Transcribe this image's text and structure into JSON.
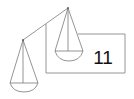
{
  "diagram": {
    "type": "balance-scale",
    "box": {
      "value": "11"
    },
    "colors": {
      "stroke": "#7a7a7a",
      "text": "#111111",
      "background": "#ffffff"
    }
  }
}
